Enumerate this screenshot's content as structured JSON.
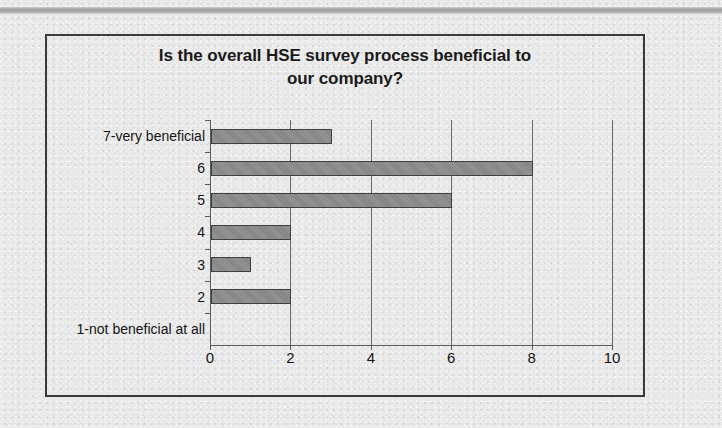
{
  "document": {
    "background_color": "#e9e9e9",
    "top_band_color": "#a9a9a9",
    "frame_color": "#3a3a3a"
  },
  "chart_data": {
    "type": "bar",
    "orientation": "horizontal",
    "title": "Is the overall HSE survey process beneficial to our company?",
    "title_line1": "Is the overall HSE survey process beneficial to",
    "title_line2": "our company?",
    "xlabel": "",
    "ylabel": "",
    "categories": [
      "1-not beneficial at all",
      "2",
      "3",
      "4",
      "5",
      "6",
      "7-very beneficial"
    ],
    "values": [
      0,
      2,
      1,
      2,
      6,
      8,
      3
    ],
    "xlim": [
      0,
      10
    ],
    "xticks": [
      0,
      2,
      4,
      6,
      8,
      10
    ],
    "xtick_labels": [
      "0",
      "2",
      "4",
      "6",
      "8",
      "10"
    ],
    "grid": "vertical",
    "legend": false,
    "bar_color": "#8a8a8a",
    "bar_border_color": "#3f3f3f",
    "gridline_color": "#6a6a6a",
    "axis_color": "#5a5a5a"
  }
}
